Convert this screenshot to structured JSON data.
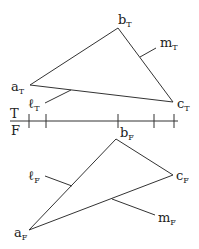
{
  "diagram": {
    "type": "descriptive-geometry-projection",
    "axis": {
      "upper_label": "T",
      "lower_label": "F",
      "ticks_x": [
        29,
        46,
        118,
        154,
        174
      ]
    },
    "top_view": {
      "vertices": [
        {
          "name": "a",
          "sub": "T",
          "x": 30,
          "y": 85
        },
        {
          "name": "b",
          "sub": "T",
          "x": 118,
          "y": 28
        },
        {
          "name": "c",
          "sub": "T",
          "x": 173,
          "y": 102
        }
      ],
      "lines": [
        {
          "name": "ℓ",
          "sub": "T"
        },
        {
          "name": "m",
          "sub": "T"
        }
      ]
    },
    "front_view": {
      "vertices": [
        {
          "name": "a",
          "sub": "F",
          "x": 29,
          "y": 230
        },
        {
          "name": "b",
          "sub": "F",
          "x": 116,
          "y": 139
        },
        {
          "name": "c",
          "sub": "F",
          "x": 173,
          "y": 175
        }
      ],
      "lines": [
        {
          "name": "ℓ",
          "sub": "F"
        },
        {
          "name": "m",
          "sub": "F"
        }
      ]
    }
  }
}
